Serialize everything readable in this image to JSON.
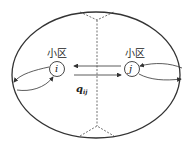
{
  "diagram": {
    "cells": [
      {
        "id": "i",
        "label": "小区",
        "node": "i"
      },
      {
        "id": "j",
        "label": "小区",
        "node": "j"
      }
    ],
    "flow": {
      "symbol": "q",
      "subscript": "ij"
    }
  }
}
